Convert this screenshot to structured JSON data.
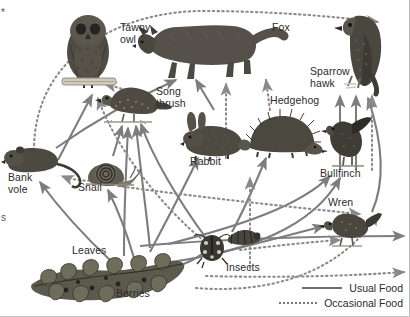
{
  "diagram": {
    "type": "food-web",
    "background_color": "#ffffff",
    "arrow_color": "#7d7d7d",
    "text_color": "#2b2b2b"
  },
  "nodes": [
    {
      "id": "tawny-owl",
      "label": "Tawny\nowl",
      "label_x": 120,
      "label_y": 27,
      "art_x": 58,
      "art_y": 14,
      "art_w": 62,
      "art_h": 72,
      "kind": "owl"
    },
    {
      "id": "fox",
      "label": "Fox",
      "label_x": 274,
      "label_y": 27,
      "art_x": 140,
      "art_y": 14,
      "art_w": 118,
      "art_h": 62,
      "kind": "fox"
    },
    {
      "id": "sparrow-hawk",
      "label": "Sparrow\nhawk",
      "label_x": 312,
      "label_y": 69,
      "art_x": 330,
      "art_y": 8,
      "art_w": 62,
      "art_h": 78,
      "kind": "hawk"
    },
    {
      "id": "song-thrush",
      "label": "Song\nthrush",
      "label_x": 155,
      "label_y": 89,
      "art_x": 100,
      "art_y": 82,
      "art_w": 62,
      "art_h": 40,
      "kind": "thrush"
    },
    {
      "id": "hedgehog",
      "label": "Hedgehog",
      "label_x": 272,
      "label_y": 98,
      "art_x": 247,
      "art_y": 112,
      "art_w": 68,
      "art_h": 42,
      "kind": "hedgehog"
    },
    {
      "id": "rabbit",
      "label": "Rabbit",
      "label_x": 190,
      "label_y": 160,
      "art_x": 182,
      "art_y": 112,
      "art_w": 62,
      "art_h": 44,
      "kind": "rabbit"
    },
    {
      "id": "bullfinch",
      "label": "Bullfinch",
      "label_x": 322,
      "label_y": 172,
      "art_x": 324,
      "art_y": 118,
      "art_w": 46,
      "art_h": 52,
      "kind": "bullfinch"
    },
    {
      "id": "wren",
      "label": "Wren",
      "label_x": 330,
      "label_y": 201,
      "art_x": 330,
      "art_y": 212,
      "art_w": 48,
      "art_h": 34,
      "kind": "wren"
    },
    {
      "id": "bank-vole",
      "label": "Bank\nvole",
      "label_x": 10,
      "label_y": 176,
      "art_x": 8,
      "art_y": 143,
      "art_w": 62,
      "art_h": 34,
      "kind": "vole"
    },
    {
      "id": "snail",
      "label": "Snail",
      "label_x": 80,
      "label_y": 186,
      "art_x": 88,
      "art_y": 155,
      "art_w": 48,
      "art_h": 30,
      "kind": "snail"
    },
    {
      "id": "insects",
      "label": "Insects",
      "label_x": 228,
      "label_y": 266,
      "art_x": 202,
      "art_y": 228,
      "art_w": 62,
      "art_h": 36,
      "kind": "insects"
    },
    {
      "id": "leaves",
      "label": "Leaves",
      "label_x": 72,
      "label_y": 249,
      "art_x": 30,
      "art_y": 262,
      "art_w": 155,
      "art_h": 44,
      "kind": "plant"
    },
    {
      "id": "berries",
      "label": "Berries",
      "label_x": 118,
      "label_y": 292,
      "art_x": 30,
      "art_y": 262,
      "art_w": 155,
      "art_h": 44,
      "kind": "plant"
    }
  ],
  "legend": {
    "items": [
      {
        "style": "solid",
        "label": "Usual Food"
      },
      {
        "style": "dotted",
        "label": "Occasional Food"
      }
    ]
  },
  "edge_fragments": {
    "left_margin_mark_top": "*",
    "left_margin_mark_mid": "s"
  },
  "links": [
    {
      "from": "leaves",
      "to": "tawny-owl",
      "style": "occasional"
    },
    {
      "from": "bank-vole",
      "to": "tawny-owl",
      "style": "usual"
    },
    {
      "from": "song-thrush",
      "to": "tawny-owl",
      "style": "occasional"
    },
    {
      "from": "insects",
      "to": "tawny-owl",
      "style": "occasional"
    },
    {
      "from": "leaves",
      "to": "sparrow-hawk",
      "style": "occasional"
    },
    {
      "from": "bank-vole",
      "to": "fox",
      "style": "usual"
    },
    {
      "from": "rabbit",
      "to": "fox",
      "style": "usual"
    },
    {
      "from": "hedgehog",
      "to": "fox",
      "style": "occasional"
    },
    {
      "from": "bullfinch",
      "to": "sparrow-hawk",
      "style": "usual"
    },
    {
      "from": "wren",
      "to": "sparrow-hawk",
      "style": "usual"
    },
    {
      "from": "insects",
      "to": "sparrow-hawk",
      "style": "occasional"
    },
    {
      "from": "snail",
      "to": "song-thrush",
      "style": "usual"
    },
    {
      "from": "insects",
      "to": "song-thrush",
      "style": "usual"
    },
    {
      "from": "leaves",
      "to": "snail",
      "style": "usual"
    },
    {
      "from": "berries",
      "to": "bank-vole",
      "style": "usual"
    },
    {
      "from": "leaves",
      "to": "rabbit",
      "style": "usual"
    },
    {
      "from": "leaves",
      "to": "insects",
      "style": "usual"
    },
    {
      "from": "berries",
      "to": "bullfinch",
      "style": "usual"
    },
    {
      "from": "insects",
      "to": "wren",
      "style": "usual"
    },
    {
      "from": "insects",
      "to": "hedgehog",
      "style": "usual"
    },
    {
      "from": "snail",
      "to": "hedgehog",
      "style": "occasional"
    }
  ]
}
